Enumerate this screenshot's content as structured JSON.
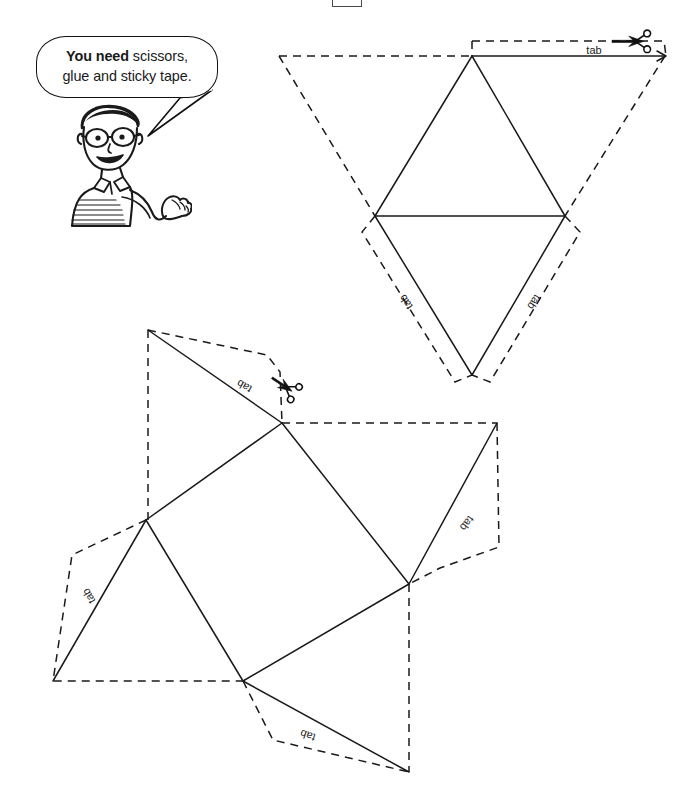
{
  "page": {
    "background_color": "#ffffff",
    "ink_color": "#1a1a1a",
    "width": 690,
    "height": 805
  },
  "crop_marker": {
    "name": "page-crop-marker",
    "visible": true
  },
  "speech_bubble": {
    "text_bold": "You need",
    "text_rest": " scissors,",
    "line2": "glue and sticky tape.",
    "full_text": "You need scissors, glue and sticky tape."
  },
  "character": {
    "name": "cartoon-boy",
    "description": "boy with glasses and striped polo shirt gesturing",
    "skin_color": "#ffffff",
    "outline_color": "#1a1a1a"
  },
  "nets": [
    {
      "id": "net-top",
      "name": "tetrahedron-net",
      "shape": "triangular pyramid (tetrahedron)",
      "tabs": [
        {
          "label": "tab",
          "position": "top-right",
          "rotation": 0
        },
        {
          "label": "tab",
          "position": "bottom-left",
          "rotation": 236
        },
        {
          "label": "tab",
          "position": "bottom-right",
          "rotation": 124
        }
      ],
      "scissors": [
        {
          "name": "scissors-icon",
          "position": "top-right",
          "rotation": 0
        }
      ]
    },
    {
      "id": "net-bottom",
      "name": "square-pyramid-net",
      "shape": "square-based pyramid",
      "tabs": [
        {
          "label": "tab",
          "position": "top-left",
          "rotation": 210
        },
        {
          "label": "tab",
          "position": "left",
          "rotation": 240
        },
        {
          "label": "tab",
          "position": "right",
          "rotation": 128
        },
        {
          "label": "tab",
          "position": "bottom",
          "rotation": 200
        }
      ],
      "scissors": [
        {
          "name": "scissors-icon",
          "position": "upper-middle",
          "rotation": 34
        }
      ]
    }
  ],
  "legend": {
    "solid_line_meaning": "cut line",
    "dashed_line_meaning": "fold line / tab outline"
  }
}
